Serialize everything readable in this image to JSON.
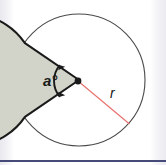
{
  "figure": {
    "name": "circle-sector-diagram",
    "width": 166,
    "height": 165
  },
  "labels": {
    "angle": "a°",
    "radius": "r"
  },
  "colors": {
    "background": "#ffffff",
    "circle_outline": "#4a4a4a",
    "sector_fill": "#d3d4c9",
    "sector_outline": "#1a1a1a",
    "radius_line": "#e8726f",
    "angle_arc": "#1a1a1a",
    "center_dot": "#1a1a1a",
    "bottom_rule": "#454a78",
    "page_tint": "#e8e8ee"
  },
  "geometry": {
    "center_x": 79,
    "center_y": 80,
    "radius_px": 66,
    "center_dot_x": 78,
    "center_dot_y": 81,
    "sector_start_angle_deg": 145,
    "sector_end_angle_deg": 215,
    "radius_label_angle_deg": -40,
    "angle_arc_radius_px": 24
  },
  "icons": {
    "center_point": "center-dot",
    "arrow_start": "arrowhead-up",
    "arrow_end": "arrowhead-down"
  }
}
